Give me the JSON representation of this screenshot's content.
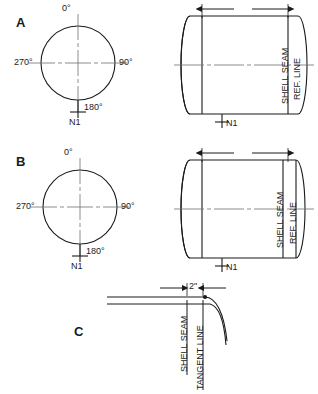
{
  "figure": {
    "background_color": "#ffffff",
    "line_color": "#1a1a1a",
    "centerline_color": "#777777"
  },
  "panels": [
    {
      "id": "A",
      "letter": "A",
      "end_view": {
        "name": "circular end view",
        "angles": [
          {
            "value": "0°",
            "position": "top"
          },
          {
            "value": "90°",
            "position": "right"
          },
          {
            "value": "180°",
            "position": "bottom"
          },
          {
            "value": "270°",
            "position": "left"
          }
        ],
        "nozzle_label": "N1"
      },
      "side_view": {
        "name": "vessel side elevation",
        "dimension": {
          "label": "",
          "arrow_style": "outward"
        },
        "vertical_labels": [
          {
            "text": "SHELL SEAM"
          },
          {
            "text": "REF. LINE"
          }
        ],
        "nozzle_label": "N1",
        "ref_line_at": "shell-seam"
      }
    },
    {
      "id": "B",
      "letter": "B",
      "end_view": {
        "name": "circular end view",
        "angles": [
          {
            "value": "0°",
            "position": "top"
          },
          {
            "value": "90°",
            "position": "right"
          },
          {
            "value": "180°",
            "position": "bottom"
          },
          {
            "value": "270°",
            "position": "left"
          }
        ],
        "nozzle_label": "N1"
      },
      "side_view": {
        "name": "vessel side elevation",
        "dimension": {
          "label": "",
          "arrow_style": "outward"
        },
        "vertical_labels": [
          {
            "text": "SHELL SEAM"
          },
          {
            "text": "REF. LINE"
          }
        ],
        "nozzle_label": "N1",
        "ref_line_at": "tangent-line"
      }
    },
    {
      "id": "C",
      "letter": "C",
      "detail_view": {
        "name": "shell to head transition detail",
        "dimension": {
          "label": "2\"",
          "arrow_style": "inward"
        },
        "vertical_labels": [
          {
            "text": "SHELL SEAM"
          },
          {
            "text": "TANGENT LINE"
          }
        ]
      }
    }
  ]
}
